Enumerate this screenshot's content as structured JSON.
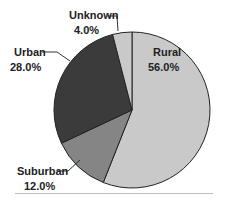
{
  "chart_data": {
    "type": "pie",
    "title": "",
    "categories": [
      "Rural",
      "Suburban",
      "Urban",
      "Unknown"
    ],
    "values": [
      56.0,
      12.0,
      28.0,
      4.0
    ],
    "value_labels": [
      "56.0%",
      "12.0%",
      "28.0%",
      "4.0%"
    ],
    "colors": [
      "#c9c9c9",
      "#858585",
      "#3b3b3b",
      "#c9c9c9"
    ],
    "start_angle": "12 o'clock",
    "direction": "clockwise",
    "legend": "none (callout labels)"
  },
  "labels": {
    "rural": {
      "name": "Rural",
      "value": "56.0%"
    },
    "suburban": {
      "name": "Suburban",
      "value": "12.0%"
    },
    "urban": {
      "name": "Urban",
      "value": "28.0%"
    },
    "unknown": {
      "name": "Unknown",
      "value": "4.0%"
    }
  }
}
